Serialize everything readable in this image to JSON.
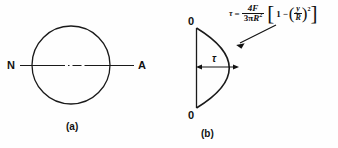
{
  "figure": {
    "panels": [
      {
        "caption": "(a)",
        "description": "circle-with-neutral-axis",
        "labels": {
          "left_axis_label": "N",
          "right_axis_label": "A"
        },
        "geometry": {
          "circle_center_x": 71,
          "circle_center_y": 65,
          "circle_radius": 39,
          "axis_line_y": 65,
          "axis_line_start_x": 20,
          "axis_line_end_x": 134
        }
      },
      {
        "caption": "(b)",
        "description": "parabolic-shear-stress-distribution",
        "labels": {
          "top_zero": "0",
          "bottom_zero": "0",
          "interior_symbol": "τ"
        },
        "geometry": {
          "vertical_line_x": 196,
          "top_y": 28,
          "bottom_y": 108,
          "peak_x": 241,
          "mid_y": 68,
          "dim_arrow_y": 67,
          "dim_arrow_start_x": 197,
          "dim_arrow_end_x": 238,
          "pointer_start_x": 275,
          "pointer_start_y": 26,
          "pointer_end_x": 237,
          "pointer_end_y": 45
        }
      }
    ],
    "equation": {
      "lhs": "τ",
      "relation": "=",
      "fraction_numerator": "4F",
      "fraction_denominator_coeff": "3π",
      "fraction_denominator_var": "R",
      "fraction_denominator_exponent": "2",
      "bracket_open": "[",
      "bracket_close": "]",
      "bracket_first_term": "1",
      "bracket_operator": "−",
      "paren_open": "(",
      "paren_close": ")",
      "inner_numerator": "y",
      "inner_denominator": "R",
      "outer_exponent": "2",
      "plain_text": "τ = 4F / (3πR²) [1 − (y/R)²]"
    },
    "colors": {
      "background": "#fefefe",
      "ink": "#111111",
      "stroke": "#1a1a1a"
    }
  }
}
